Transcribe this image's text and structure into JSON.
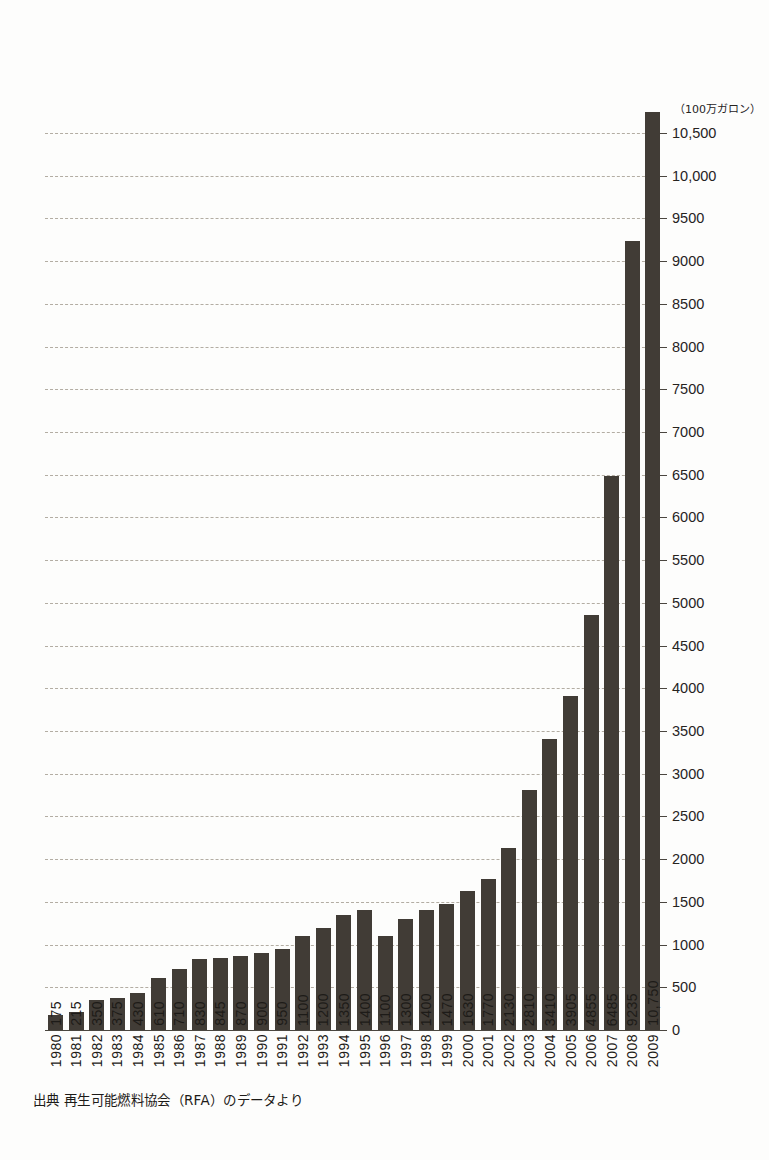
{
  "chart_data": {
    "type": "bar",
    "title": "",
    "subtitle": "",
    "xlabel": "",
    "ylabel": "",
    "unit_label": "（100万ガロン）",
    "source_note": "出典 再生可能燃料協会（RFA）のデータより",
    "orientation": "vertical",
    "grid": true,
    "legend": "none",
    "ylim": [
      0,
      10500
    ],
    "ytick_step": 500,
    "ytick_labels": [
      "10,500",
      "10,000",
      "9500",
      "9000",
      "8500",
      "8000",
      "7500",
      "7000",
      "6500",
      "6000",
      "5500",
      "5000",
      "4500",
      "4000",
      "3500",
      "3000",
      "2500",
      "2000",
      "1500",
      "1000",
      "500",
      "0"
    ],
    "ytick_values": [
      10500,
      10000,
      9500,
      9000,
      8500,
      8000,
      7500,
      7000,
      6500,
      6000,
      5500,
      5000,
      4500,
      4000,
      3500,
      3000,
      2500,
      2000,
      1500,
      1000,
      500,
      0
    ],
    "bar_color": "#413c36",
    "gridline_color": "#b3ada3",
    "categories": [
      "1980",
      "1981",
      "1982",
      "1983",
      "1984",
      "1985",
      "1986",
      "1987",
      "1988",
      "1989",
      "1990",
      "1991",
      "1992",
      "1993",
      "1994",
      "1995",
      "1996",
      "1997",
      "1998",
      "1999",
      "2000",
      "2001",
      "2002",
      "2003",
      "2004",
      "2005",
      "2006",
      "2007",
      "2008",
      "2009"
    ],
    "values": [
      175,
      215,
      350,
      375,
      430,
      610,
      710,
      830,
      845,
      870,
      900,
      950,
      1100,
      1200,
      1350,
      1400,
      1100,
      1300,
      1400,
      1470,
      1630,
      1770,
      2130,
      2810,
      3410,
      3905,
      4855,
      6485,
      9235,
      10750
    ],
    "value_labels": [
      "175",
      "215",
      "350",
      "375",
      "430",
      "610",
      "710",
      "830",
      "845",
      "870",
      "900",
      "950",
      "1100",
      "1200",
      "1350",
      "1400",
      "1100",
      "1300",
      "1400",
      "1470",
      "1630",
      "1770",
      "2130",
      "2810",
      "3410",
      "3905",
      "4855",
      "6485",
      "9235",
      "10,750"
    ]
  }
}
